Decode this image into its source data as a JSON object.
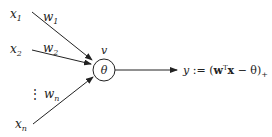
{
  "diagram": {
    "type": "perceptron-neuron",
    "inputs": [
      {
        "label": "x",
        "sub": "1",
        "weight": "w",
        "weight_sub": "1"
      },
      {
        "label": "x",
        "sub": "2",
        "weight": "w",
        "weight_sub": "2"
      },
      {
        "label": "x",
        "sub": "n",
        "weight": "w",
        "weight_sub": "n"
      }
    ],
    "ellipsis": "⋮",
    "node": {
      "top_label": "v",
      "inner_label": "θ"
    },
    "output": {
      "y": "y",
      "assign": " := (",
      "w": "w",
      "T": "T",
      "x": "x",
      "minus_theta": " − θ)",
      "plus": "+"
    },
    "colors": {
      "stroke": "#222222",
      "background": "#ffffff"
    }
  }
}
